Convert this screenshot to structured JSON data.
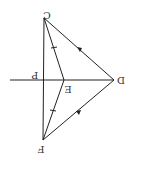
{
  "diagram": {
    "type": "geometry",
    "orientation": "rotated-180",
    "stroke_color": "#222222",
    "points": {
      "C": {
        "label": "C",
        "x": 44,
        "y": 18
      },
      "F": {
        "label": "F",
        "x": 43,
        "y": 140
      },
      "D": {
        "label": "D",
        "x": 114,
        "y": 80
      },
      "E": {
        "label": "E",
        "x": 64,
        "y": 80
      },
      "P": {
        "label": "P",
        "x": 43,
        "y": 80
      }
    },
    "segments": [
      {
        "from": "C",
        "to": "D",
        "mark": "arrow"
      },
      {
        "from": "D",
        "to": "F",
        "mark": "arrow"
      },
      {
        "from": "C",
        "to": "E",
        "mark": "tick"
      },
      {
        "from": "E",
        "to": "F",
        "mark": "tick"
      },
      {
        "from": "C",
        "to": "F",
        "mark": "none"
      },
      {
        "from": "E",
        "to": "D",
        "mark": "none"
      }
    ],
    "extension_line": {
      "from_x": 10,
      "to": "D",
      "y": 80
    }
  }
}
